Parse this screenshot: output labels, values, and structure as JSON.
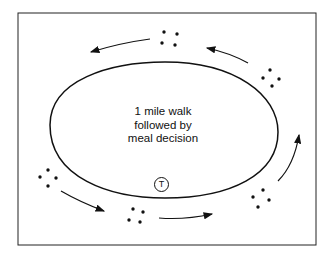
{
  "diagram": {
    "center_label": {
      "line1": "1 mile walk",
      "line2": "followed by",
      "line3": "meal decision"
    },
    "track_marker": "T",
    "groups": [
      {
        "name": "top",
        "dots": 4
      },
      {
        "name": "upper-right",
        "dots": 4
      },
      {
        "name": "lower-right",
        "dots": 4
      },
      {
        "name": "bottom",
        "dots": 4
      },
      {
        "name": "left",
        "dots": 4
      }
    ],
    "flow_direction": "counterclockwise",
    "colors": {
      "stroke": "#111111",
      "background": "#ffffff"
    }
  }
}
